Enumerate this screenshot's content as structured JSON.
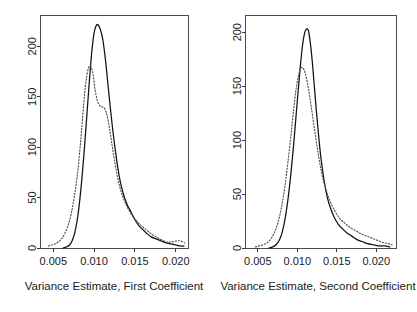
{
  "figure": {
    "title": "",
    "background_color": "#ffffff",
    "panel_count": 2
  },
  "chart_data": [
    {
      "type": "line",
      "title": "",
      "xlabel": "Variance Estimate, First Coefficient",
      "ylabel": "",
      "xlim": [
        0.0035,
        0.0215
      ],
      "ylim": [
        0,
        230
      ],
      "xticks": [
        0.005,
        0.01,
        0.015,
        0.02
      ],
      "xticklabels": [
        "0.005",
        "0.010",
        "0.015",
        "0.020"
      ],
      "yticks": [
        0,
        50,
        100,
        150,
        200
      ],
      "yticklabels": [
        "0",
        "50",
        "100",
        "150",
        "200"
      ],
      "grid": false,
      "legend": "none",
      "series": [
        {
          "name": "solid",
          "style": "solid",
          "color": "#111111",
          "x": [
            0.0062,
            0.0066,
            0.007,
            0.0073,
            0.0076,
            0.0079,
            0.0082,
            0.0085,
            0.0088,
            0.0091,
            0.0094,
            0.0097,
            0.01,
            0.0103,
            0.0106,
            0.0109,
            0.0111,
            0.0114,
            0.0117,
            0.012,
            0.0123,
            0.0126,
            0.0129,
            0.0132,
            0.0135,
            0.0138,
            0.0141,
            0.0145,
            0.015,
            0.0155,
            0.016,
            0.0165,
            0.017,
            0.0176,
            0.0182,
            0.0188,
            0.0194,
            0.02,
            0.0206,
            0.021
          ],
          "y": [
            0,
            1,
            3,
            7,
            14,
            26,
            44,
            68,
            97,
            130,
            163,
            193,
            213,
            221,
            220,
            213,
            205,
            186,
            162,
            138,
            116,
            97,
            80,
            66,
            56,
            48,
            42,
            36,
            28,
            22,
            18,
            14,
            11,
            9,
            7,
            5,
            4,
            3,
            2,
            2
          ]
        },
        {
          "name": "dotted",
          "style": "dotted",
          "color": "#4d4d4d",
          "x": [
            0.0044,
            0.0048,
            0.0052,
            0.0056,
            0.006,
            0.0064,
            0.0068,
            0.0072,
            0.0076,
            0.008,
            0.0084,
            0.0087,
            0.009,
            0.0093,
            0.0096,
            0.0099,
            0.0101,
            0.0104,
            0.0107,
            0.011,
            0.0113,
            0.0116,
            0.0119,
            0.0122,
            0.0125,
            0.0129,
            0.0133,
            0.0137,
            0.0141,
            0.0146,
            0.0152,
            0.0158,
            0.0164,
            0.017,
            0.0176,
            0.0183,
            0.0189,
            0.0195,
            0.0201,
            0.0206,
            0.0211
          ],
          "y": [
            2,
            3,
            4,
            6,
            9,
            14,
            22,
            34,
            52,
            76,
            110,
            140,
            165,
            178,
            180,
            171,
            158,
            146,
            141,
            140,
            138,
            131,
            118,
            102,
            87,
            69,
            56,
            47,
            40,
            33,
            27,
            22,
            18,
            14,
            11,
            8,
            6,
            6,
            7,
            7,
            5
          ]
        }
      ]
    },
    {
      "type": "line",
      "title": "",
      "xlabel": "Variance Estimate, Second Coefficient",
      "ylabel": "",
      "xlim": [
        0.0035,
        0.0225
      ],
      "ylim": [
        0,
        215
      ],
      "xticks": [
        0.005,
        0.01,
        0.015,
        0.02
      ],
      "xticklabels": [
        "0.005",
        "0.010",
        "0.015",
        "0.020"
      ],
      "yticks": [
        0,
        50,
        100,
        150,
        200
      ],
      "yticklabels": [
        "0",
        "50",
        "100",
        "150",
        "200"
      ],
      "grid": false,
      "legend": "none",
      "series": [
        {
          "name": "solid",
          "style": "solid",
          "color": "#111111",
          "x": [
            0.0064,
            0.0069,
            0.0073,
            0.0077,
            0.0081,
            0.0085,
            0.0089,
            0.0092,
            0.0095,
            0.0098,
            0.0101,
            0.0104,
            0.0107,
            0.011,
            0.0113,
            0.0115,
            0.0118,
            0.0121,
            0.0124,
            0.0127,
            0.013,
            0.0134,
            0.0138,
            0.0142,
            0.0147,
            0.0152,
            0.0157,
            0.0163,
            0.0169,
            0.0175,
            0.0182,
            0.0189,
            0.0196,
            0.0203,
            0.021,
            0.0217
          ],
          "y": [
            0,
            1,
            3,
            7,
            15,
            29,
            50,
            70,
            93,
            119,
            145,
            170,
            190,
            201,
            203,
            198,
            180,
            155,
            128,
            104,
            83,
            62,
            47,
            37,
            28,
            22,
            18,
            14,
            11,
            8,
            6,
            4,
            3,
            2,
            2,
            1
          ]
        },
        {
          "name": "dotted",
          "style": "dotted",
          "color": "#4d4d4d",
          "x": [
            0.0047,
            0.0052,
            0.0057,
            0.0062,
            0.0067,
            0.0072,
            0.0076,
            0.008,
            0.0084,
            0.0088,
            0.0092,
            0.0095,
            0.0098,
            0.0101,
            0.0104,
            0.0107,
            0.011,
            0.0113,
            0.0116,
            0.0119,
            0.0123,
            0.0127,
            0.0131,
            0.0136,
            0.0141,
            0.0147,
            0.0153,
            0.016,
            0.0167,
            0.0174,
            0.0181,
            0.0188,
            0.0195,
            0.0202,
            0.0209,
            0.0216,
            0.022
          ],
          "y": [
            1,
            2,
            3,
            5,
            9,
            16,
            25,
            38,
            56,
            79,
            105,
            126,
            145,
            158,
            166,
            167,
            162,
            152,
            139,
            124,
            104,
            85,
            69,
            55,
            44,
            35,
            28,
            23,
            19,
            16,
            13,
            11,
            9,
            7,
            5,
            4,
            3
          ]
        }
      ]
    }
  ]
}
